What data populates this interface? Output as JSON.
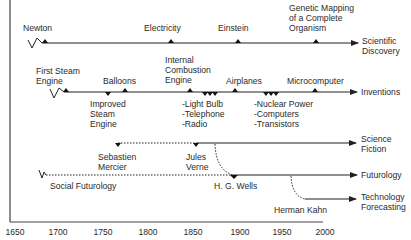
{
  "diagram": {
    "type": "timeline",
    "tracks": [
      {
        "name": "Scientific Discovery",
        "label": "Scientific\nDiscovery",
        "events": [
          {
            "label": "Newton",
            "year": 1687
          },
          {
            "label": "Electricity",
            "year": 1820
          },
          {
            "label": "Einstein",
            "year": 1905
          },
          {
            "label": "Genetic Mapping\nof a Complete\nOrganism",
            "year": 1995
          }
        ]
      },
      {
        "name": "Inventions",
        "label": "Inventions",
        "events": [
          {
            "label": "First Steam\nEngine",
            "year": 1698
          },
          {
            "label": "Balloons",
            "year": 1783
          },
          {
            "label": "Improved\nSteam\nEngine",
            "year": 1765
          },
          {
            "label": "Internal\nCombustion\nEngine",
            "year": 1860
          },
          {
            "label": "-Light Bulb\n-Telephone\n-Radio",
            "year": 1880
          },
          {
            "label": "Airplanes",
            "year": 1903
          },
          {
            "label": "-Nuclear Power\n-Computers\n-Transistors",
            "year": 1945
          },
          {
            "label": "Microcomputer",
            "year": 1975
          }
        ]
      },
      {
        "name": "Science Fiction",
        "label": "Science\nFiction",
        "events": [
          {
            "label": "Sebastien\nMercier",
            "year": 1771
          },
          {
            "label": "Jules\nVerne",
            "year": 1865
          }
        ]
      },
      {
        "name": "Futurology",
        "label": "Futurology",
        "events": [
          {
            "label": "Social Futurology",
            "year": 1700
          },
          {
            "label": "H. G. Wells",
            "year": 1901
          }
        ]
      },
      {
        "name": "Technology Forecasting",
        "label": "Technology\nForecasting",
        "events": [
          {
            "label": "Herman Kahn",
            "year": 1960
          }
        ]
      }
    ],
    "x_axis": {
      "ticks": [
        "1650",
        "1700",
        "1750",
        "1800",
        "1850",
        "1900",
        "1950",
        "2000"
      ]
    }
  },
  "labels": {
    "newton": "Newton",
    "electricity": "Electricity",
    "einstein": "Einstein",
    "genetic": "Genetic Mapping\nof a Complete\nOrganism",
    "sci_disc": "Scientific\nDiscovery",
    "first_steam": "First Steam\nEngine",
    "balloons": "Balloons",
    "ice": "Internal\nCombustion\nEngine",
    "airplanes": "Airplanes",
    "micro": "Microcomputer",
    "inventions": "Inventions",
    "improved_steam": "Improved\nSteam\nEngine",
    "lightbulb": "-Light Bulb\n-Telephone\n-Radio",
    "nuclear": "-Nuclear Power\n-Computers\n-Transistors",
    "mercier": "Sebastien\nMercier",
    "verne": "Jules\nVerne",
    "sci_fi": "Science\nFiction",
    "futurology": "Futurology",
    "social_fut": "Social Futurology",
    "wells": "H. G. Wells",
    "kahn": "Herman Kahn",
    "tech_fore": "Technology\nForecasting"
  },
  "ticks": [
    "1650",
    "1700",
    "1750",
    "1800",
    "1850",
    "1900",
    "1950",
    "2000"
  ]
}
